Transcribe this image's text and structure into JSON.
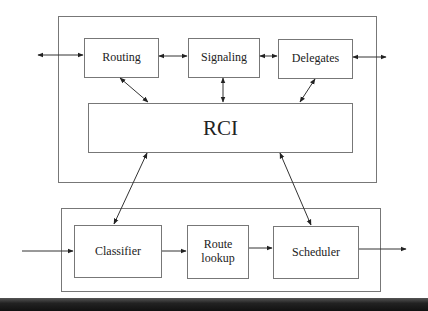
{
  "diagram": {
    "control_plane": {
      "modules": [
        {
          "id": "routing",
          "label": "Routing"
        },
        {
          "id": "signaling",
          "label": "Signaling"
        },
        {
          "id": "delegates",
          "label": "Delegates"
        }
      ],
      "interface": {
        "id": "rci",
        "label": "RCI"
      }
    },
    "data_plane": {
      "stages": [
        {
          "id": "classifier",
          "label": "Classifier"
        },
        {
          "id": "route-lookup",
          "label": "Route lookup",
          "line1": "Route",
          "line2": "lookup"
        },
        {
          "id": "scheduler",
          "label": "Scheduler"
        }
      ]
    },
    "edges": [
      {
        "from": "external-left",
        "to": "routing",
        "type": "bidirectional"
      },
      {
        "from": "routing",
        "to": "signaling",
        "type": "bidirectional"
      },
      {
        "from": "signaling",
        "to": "delegates",
        "type": "bidirectional"
      },
      {
        "from": "delegates",
        "to": "external-right",
        "type": "bidirectional"
      },
      {
        "from": "routing",
        "to": "rci",
        "type": "bidirectional"
      },
      {
        "from": "signaling",
        "to": "rci",
        "type": "bidirectional"
      },
      {
        "from": "delegates",
        "to": "rci",
        "type": "bidirectional"
      },
      {
        "from": "rci",
        "to": "classifier",
        "type": "bidirectional"
      },
      {
        "from": "rci",
        "to": "scheduler",
        "type": "bidirectional"
      },
      {
        "from": "input",
        "to": "classifier",
        "type": "directed"
      },
      {
        "from": "classifier",
        "to": "route-lookup",
        "type": "directed"
      },
      {
        "from": "route-lookup",
        "to": "scheduler",
        "type": "directed"
      },
      {
        "from": "scheduler",
        "to": "output",
        "type": "directed"
      }
    ]
  }
}
